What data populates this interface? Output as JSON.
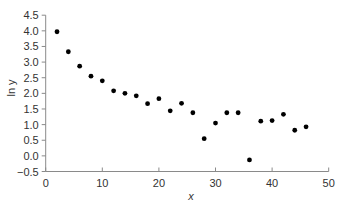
{
  "chart_data": {
    "type": "scatter",
    "title": "",
    "xlabel": "x",
    "ylabel": "ln y",
    "xlim": [
      0,
      50
    ],
    "ylim": [
      -0.5,
      4.5
    ],
    "xticks": [
      0,
      10,
      20,
      30,
      40,
      50
    ],
    "yticks": [
      -0.5,
      0.0,
      0.5,
      1.0,
      1.5,
      2.0,
      2.5,
      3.0,
      3.5,
      4.0,
      4.5
    ],
    "ytick_labels": [
      "−0.5",
      "0.0",
      "0.5",
      "1.0",
      "1.5",
      "2.0",
      "2.5",
      "3.0",
      "3.5",
      "4.0",
      "4.5"
    ],
    "xtick_labels": [
      "0",
      "10",
      "20",
      "30",
      "40",
      "50"
    ],
    "grid": false,
    "legend": null,
    "series": [
      {
        "name": "ln y",
        "color": "#000000",
        "x": [
          2,
          4,
          6,
          8,
          10,
          12,
          14,
          16,
          18,
          20,
          22,
          24,
          26,
          28,
          30,
          32,
          34,
          36,
          38,
          40,
          42,
          44,
          46
        ],
        "y": [
          3.97,
          3.33,
          2.87,
          2.55,
          2.4,
          2.08,
          2.0,
          1.92,
          1.67,
          1.83,
          1.44,
          1.68,
          1.38,
          0.55,
          1.05,
          1.38,
          1.38,
          -0.13,
          1.11,
          1.13,
          1.33,
          0.82,
          0.93
        ]
      }
    ]
  },
  "colors": {
    "axis": "#8a8a8a",
    "text": "#333333",
    "points": "#000000"
  }
}
